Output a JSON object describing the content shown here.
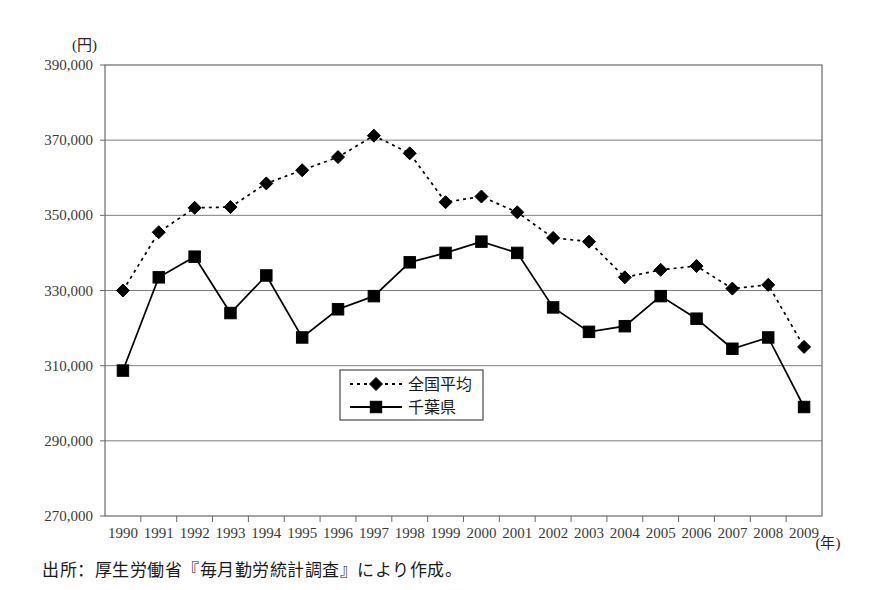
{
  "chart_data": {
    "type": "line",
    "title": "",
    "xlabel": "(年)",
    "ylabel": "(円)",
    "categories": [
      "1990",
      "1991",
      "1992",
      "1993",
      "1994",
      "1995",
      "1996",
      "1997",
      "1998",
      "1999",
      "2000",
      "2001",
      "2002",
      "2003",
      "2004",
      "2005",
      "2006",
      "2007",
      "2008",
      "2009"
    ],
    "ylim": [
      270000,
      390000
    ],
    "ytick_step": 20000,
    "yticks": [
      "390,000",
      "370,000",
      "350,000",
      "330,000",
      "310,000",
      "290,000",
      "270,000"
    ],
    "ytick_values": [
      390000,
      370000,
      350000,
      330000,
      310000,
      290000,
      270000
    ],
    "grid": true,
    "legend_position": "center",
    "series": [
      {
        "name": "全国平均",
        "marker": "diamond",
        "line_style": "dotted",
        "color": "#000000",
        "values": [
          330000,
          345500,
          352000,
          352200,
          358500,
          362000,
          365500,
          371200,
          366500,
          353500,
          355000,
          350800,
          344000,
          343000,
          333500,
          335500,
          336500,
          330500,
          331500,
          315000
        ]
      },
      {
        "name": "千葉県",
        "marker": "square",
        "line_style": "solid",
        "color": "#000000",
        "values": [
          308700,
          333500,
          339000,
          324000,
          334000,
          317500,
          325000,
          328500,
          337500,
          340000,
          343000,
          340000,
          325500,
          319000,
          320500,
          328500,
          322500,
          314500,
          317500,
          299000
        ]
      }
    ]
  },
  "footer": {
    "source_note": "出所：厚生労働省『毎月勤労統計調査』により作成。"
  },
  "plot_geometry": {
    "left": 105,
    "right": 822,
    "top": 65,
    "bottom": 516
  },
  "legend_box": {
    "x": 340,
    "y": 370,
    "width": 143,
    "height": 50
  }
}
